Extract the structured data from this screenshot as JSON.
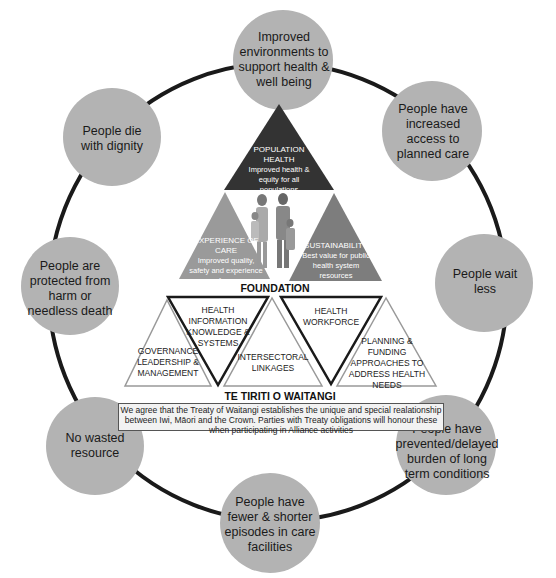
{
  "colors": {
    "circle_fill": "#b3b3b3",
    "ring_stroke": "#1a1a1a",
    "population_health": "#333333",
    "experience_of_care": "#9a9a9a",
    "sustainability": "#7d7d7d",
    "foundation_stroke": "#999999",
    "foundation_inverted_stroke": "#1a1a1a"
  },
  "outcomes": [
    {
      "id": "top",
      "label": "Improved environments to support health & well being"
    },
    {
      "id": "top-right",
      "label": "People have increased access to planned care"
    },
    {
      "id": "right",
      "label": "People wait less"
    },
    {
      "id": "bottom-right",
      "label": "People have prevented/delayed burden of long term conditions"
    },
    {
      "id": "bottom",
      "label": "People have fewer & shorter episodes in care facilities"
    },
    {
      "id": "bottom-left",
      "label": "No wasted resource"
    },
    {
      "id": "left",
      "label": "People are protected from harm or needless death"
    },
    {
      "id": "top-left",
      "label": "People die with dignity"
    }
  ],
  "triple_aim": {
    "population_health": {
      "title": "POPULATION HEALTH",
      "desc": "Improved health & equity for all populations"
    },
    "experience_of_care": {
      "title": "EXPERIENCE OF CARE",
      "desc": "Improved quality, safety and experience of care"
    },
    "sustainability": {
      "title": "SUSTAINABILITY",
      "desc": "Best value for public health system resources"
    },
    "center_image": "family-illustration"
  },
  "foundation": {
    "heading": "FOUNDATION",
    "items": [
      {
        "label": "GOVERNANCE LEADERSHIP & MANAGEMENT"
      },
      {
        "label": "HEALTH INFORMATION KNOWLEDGE & SYSTEMS"
      },
      {
        "label": "INTERSECTORAL LINKAGES"
      },
      {
        "label": "HEALTH WORKFORCE"
      },
      {
        "label": "PLANNING & FUNDING APPROACHES TO ADDRESS HEALTH NEEDS"
      }
    ]
  },
  "treaty": {
    "heading": "TE TIRITI O WAITANGI",
    "text": "We agree that the Treaty of Waitangi establishes the unique and special realationship between Iwi, Māori and the Crown. Parties with Treaty obligations will honour these when participating in Alliance activities"
  }
}
